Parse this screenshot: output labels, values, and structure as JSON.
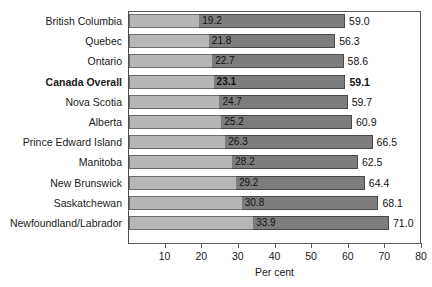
{
  "chart_data": {
    "type": "bar",
    "subtype": "stacked-horizontal",
    "title": "",
    "xlabel": "Per cent",
    "ylabel": "",
    "xlim": [
      0,
      80
    ],
    "xticks": [
      10,
      20,
      30,
      40,
      50,
      60,
      70,
      80
    ],
    "grid": false,
    "legend": "none",
    "categories": [
      "British Columbia",
      "Quebec",
      "Ontario",
      "Canada Overall",
      "Nova Scotia",
      "Alberta",
      "Prince Edward Island",
      "Manitoba",
      "New Brunswick",
      "Saskatchewan",
      "Newfoundland/Labrador"
    ],
    "highlight_category": "Canada Overall",
    "series": [
      {
        "name": "inner",
        "color": "#b6b6b6",
        "values": [
          19.2,
          21.8,
          22.7,
          23.1,
          24.7,
          25.2,
          26.3,
          28.2,
          29.2,
          30.8,
          33.9
        ]
      },
      {
        "name": "total",
        "color": "#7d7d7d",
        "values": [
          59.0,
          56.3,
          58.6,
          59.1,
          59.7,
          60.9,
          66.5,
          62.5,
          64.4,
          68.1,
          71.0
        ]
      }
    ],
    "rows": [
      {
        "label": "British Columbia",
        "inner": 19.2,
        "total": 59.0,
        "inner_text": "19.2",
        "total_text": "59.0",
        "highlight": false
      },
      {
        "label": "Quebec",
        "inner": 21.8,
        "total": 56.3,
        "inner_text": "21.8",
        "total_text": "56.3",
        "highlight": false
      },
      {
        "label": "Ontario",
        "inner": 22.7,
        "total": 58.6,
        "inner_text": "22.7",
        "total_text": "58.6",
        "highlight": false
      },
      {
        "label": "Canada Overall",
        "inner": 23.1,
        "total": 59.1,
        "inner_text": "23.1",
        "total_text": "59.1",
        "highlight": true
      },
      {
        "label": "Nova Scotia",
        "inner": 24.7,
        "total": 59.7,
        "inner_text": "24.7",
        "total_text": "59.7",
        "highlight": false
      },
      {
        "label": "Alberta",
        "inner": 25.2,
        "total": 60.9,
        "inner_text": "25.2",
        "total_text": "60.9",
        "highlight": false
      },
      {
        "label": "Prince Edward Island",
        "inner": 26.3,
        "total": 66.5,
        "inner_text": "26.3",
        "total_text": "66.5",
        "highlight": false
      },
      {
        "label": "Manitoba",
        "inner": 28.2,
        "total": 62.5,
        "inner_text": "28.2",
        "total_text": "62.5",
        "highlight": false
      },
      {
        "label": "New Brunswick",
        "inner": 29.2,
        "total": 64.4,
        "inner_text": "29.2",
        "total_text": "64.4",
        "highlight": false
      },
      {
        "label": "Saskatchewan",
        "inner": 30.8,
        "total": 68.1,
        "inner_text": "30.8",
        "total_text": "68.1",
        "highlight": false
      },
      {
        "label": "Newfoundland/Labrador",
        "inner": 33.9,
        "total": 71.0,
        "inner_text": "33.9",
        "total_text": "71.0",
        "highlight": false
      }
    ],
    "colors": {
      "inner_fill": "#b6b6b6",
      "total_fill": "#7d7d7d",
      "bar_stroke": "#4a4a4a",
      "axis": "#5a5a5a",
      "text": "#1a1a1a",
      "background": "#ffffff"
    }
  }
}
